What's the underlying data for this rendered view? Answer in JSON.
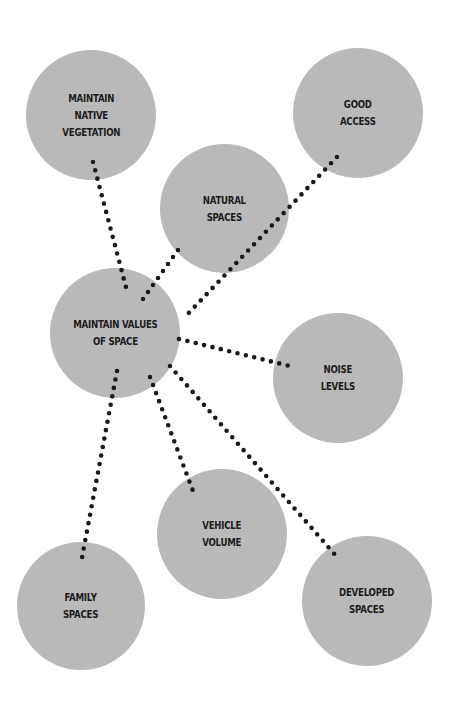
{
  "diagram": {
    "type": "concept-map",
    "colors": {
      "node_fill": "#b9b9b9",
      "connector": "#1a1a1a",
      "text": "#1c1c1c",
      "background": "#ffffff"
    },
    "center_node": {
      "id": "values",
      "label": "MAINTAIN VALUES\nOF SPACE"
    },
    "nodes": [
      {
        "id": "vegetation",
        "label": "MAINTAIN\nNATIVE\nVEGETATION"
      },
      {
        "id": "access",
        "label": "GOOD\nACCESS"
      },
      {
        "id": "natural",
        "label": "NATURAL\nSPACES"
      },
      {
        "id": "noise",
        "label": "NOISE\nLEVELS"
      },
      {
        "id": "vehicle",
        "label": "VEHICLE\nVOLUME"
      },
      {
        "id": "family",
        "label": "FAMILY\nSPACES"
      },
      {
        "id": "developed",
        "label": "DEVELOPED\nSPACES"
      }
    ],
    "connections": [
      {
        "from": "values",
        "to": "vegetation"
      },
      {
        "from": "values",
        "to": "natural"
      },
      {
        "from": "values",
        "to": "access"
      },
      {
        "from": "values",
        "to": "noise"
      },
      {
        "from": "values",
        "to": "vehicle"
      },
      {
        "from": "values",
        "to": "family"
      },
      {
        "from": "values",
        "to": "developed"
      }
    ]
  }
}
